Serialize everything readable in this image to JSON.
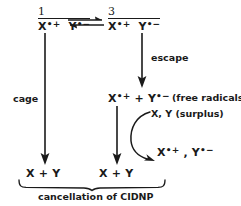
{
  "diagram": {
    "ink_color": "#1a1a1a",
    "background_color": "#ffffff",
    "species": {
      "singlet_pair": {
        "multiplicity": "1",
        "formula": "X•+ Y•−",
        "x_label": "X",
        "x_dot": "•",
        "x_charge": "+",
        "y_label": "Y",
        "y_dot": "•",
        "y_charge": "−"
      },
      "triplet_pair": {
        "multiplicity": "3",
        "formula": "X•+ Y•−",
        "x_label": "X",
        "x_dot": "•",
        "x_charge": "+",
        "y_label": "Y",
        "y_dot": "•",
        "y_charge": "−"
      },
      "free_radicals": {
        "x_label": "X",
        "x_dot": "•",
        "x_charge": "+",
        "separator": "+",
        "y_label": "Y",
        "y_dot": "•",
        "y_charge": "−",
        "annotation": "(free radicals)"
      },
      "regenerated_radicals": {
        "x_label": "X",
        "x_dot": "•",
        "x_charge": "+",
        "separator": ",",
        "y_label": "Y",
        "y_dot": "•",
        "y_charge": "−"
      },
      "product_left": {
        "x_label": "X",
        "separator": "+",
        "y_label": "Y"
      },
      "product_right": {
        "x_label": "X",
        "separator": "+",
        "y_label": "Y"
      },
      "surplus_reagents": {
        "text": "X, Y (surplus)"
      }
    },
    "labels": {
      "cage": "cage",
      "escape": "escape",
      "caption": "cancellation of CIDNP"
    },
    "arrows": {
      "equilibrium": "equilibrium-double-harpoon",
      "cage_path": "downward-arrow",
      "escape_path": "downward-arrow",
      "recombination_path": "downward-arrow",
      "surplus_curve": "curved-arrow",
      "brace": "under-brace"
    }
  }
}
